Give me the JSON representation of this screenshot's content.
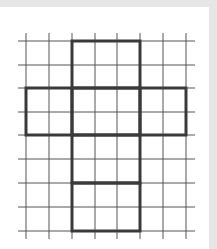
{
  "diagram": {
    "type": "grid-net",
    "grid": {
      "columns": 7,
      "rows": 8,
      "x_lines": [
        26,
        49,
        72,
        95,
        117,
        140,
        163,
        186
      ],
      "y_lines": [
        41,
        65,
        88,
        112,
        135,
        159,
        183,
        207,
        231
      ],
      "line_color": "#555555",
      "outline_color": "#3a3a3a"
    },
    "net_faces": [
      {
        "name": "top",
        "col": 2,
        "row": 0,
        "cols": 3,
        "rows": 2
      },
      {
        "name": "left",
        "col": 0,
        "row": 2,
        "cols": 2,
        "rows": 2
      },
      {
        "name": "center",
        "col": 2,
        "row": 2,
        "cols": 3,
        "rows": 2
      },
      {
        "name": "right",
        "col": 5,
        "row": 2,
        "cols": 2,
        "rows": 2
      },
      {
        "name": "lower-middle",
        "col": 2,
        "row": 4,
        "cols": 3,
        "rows": 2
      },
      {
        "name": "bottom",
        "col": 2,
        "row": 6,
        "cols": 3,
        "rows": 2
      }
    ]
  }
}
